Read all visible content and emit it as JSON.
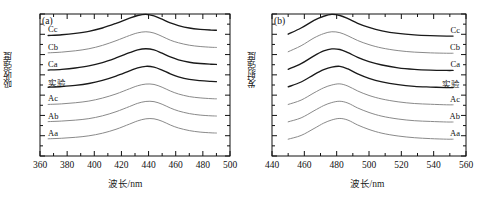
{
  "figure": {
    "panels": [
      {
        "tag": "(a)",
        "xlabel": "波长/nm",
        "ylabel": "吸收强度",
        "label_side": "left"
      },
      {
        "tag": "(b)",
        "xlabel": "波长/nm",
        "ylabel": "发射强度",
        "label_side": "right"
      }
    ]
  },
  "chart_data": [
    {
      "type": "line",
      "title": "(a)",
      "xlabel": "波长/nm",
      "ylabel": "吸收强度",
      "xlim": [
        360,
        500
      ],
      "ylim": [
        0,
        7.6
      ],
      "xticks": [
        360,
        380,
        400,
        420,
        440,
        460,
        480,
        500
      ],
      "xtick_labels": [
        "360",
        "380",
        "400",
        "420",
        "440",
        "460",
        "480",
        "500"
      ],
      "yticks": [],
      "ytick_labels": [],
      "minor_tick_step": 10,
      "grid": false,
      "legend": "inline-curve-labels",
      "x": [
        366,
        376,
        386,
        396,
        406,
        416,
        426,
        432,
        438,
        444,
        450,
        456,
        462,
        470,
        478,
        486,
        490
      ],
      "series": [
        {
          "name": "Cc",
          "label": "Cc",
          "color": "#1a1a1a",
          "peak_nm": 438,
          "baseline": 6.45,
          "values": [
            6.45,
            6.49,
            6.56,
            6.67,
            6.85,
            7.1,
            7.38,
            7.52,
            7.58,
            7.5,
            7.32,
            7.12,
            6.98,
            6.85,
            6.78,
            6.74,
            6.73
          ]
        },
        {
          "name": "Cb",
          "label": "Cb",
          "color": "#8a8a8a",
          "peak_nm": 439,
          "baseline": 5.52,
          "values": [
            5.52,
            5.56,
            5.63,
            5.74,
            5.92,
            6.17,
            6.45,
            6.59,
            6.65,
            6.58,
            6.4,
            6.2,
            6.06,
            5.93,
            5.86,
            5.82,
            5.81
          ]
        },
        {
          "name": "Ca",
          "label": "Ca",
          "color": "#1a1a1a",
          "peak_nm": 441,
          "baseline": 4.6,
          "values": [
            4.6,
            4.64,
            4.71,
            4.82,
            5.0,
            5.25,
            5.53,
            5.68,
            5.74,
            5.68,
            5.5,
            5.3,
            5.15,
            5.02,
            4.95,
            4.91,
            4.9
          ]
        },
        {
          "name": "实验",
          "label": "实验",
          "color": "#1a1a1a",
          "peak_nm": 443,
          "baseline": 3.68,
          "values": [
            3.68,
            3.72,
            3.78,
            3.88,
            4.05,
            4.28,
            4.56,
            4.72,
            4.8,
            4.76,
            4.6,
            4.4,
            4.24,
            4.1,
            4.03,
            3.99,
            3.98
          ]
        },
        {
          "name": "Ac",
          "label": "Ac",
          "color": "#8a8a8a",
          "peak_nm": 445,
          "baseline": 2.76,
          "values": [
            2.76,
            2.79,
            2.85,
            2.94,
            3.1,
            3.32,
            3.6,
            3.76,
            3.85,
            3.83,
            3.68,
            3.48,
            3.32,
            3.18,
            3.11,
            3.07,
            3.06
          ]
        },
        {
          "name": "Ab",
          "label": "Ab",
          "color": "#8a8a8a",
          "peak_nm": 446,
          "baseline": 1.84,
          "values": [
            1.84,
            1.87,
            1.92,
            2.0,
            2.15,
            2.37,
            2.65,
            2.82,
            2.92,
            2.91,
            2.77,
            2.57,
            2.41,
            2.27,
            2.19,
            2.15,
            2.14
          ]
        },
        {
          "name": "Aa",
          "label": "Aa",
          "color": "#8a8a8a",
          "peak_nm": 447,
          "baseline": 0.92,
          "values": [
            0.92,
            0.95,
            1.0,
            1.08,
            1.22,
            1.43,
            1.71,
            1.88,
            1.99,
            1.99,
            1.86,
            1.66,
            1.5,
            1.36,
            1.28,
            1.24,
            1.23
          ]
        }
      ]
    },
    {
      "type": "line",
      "title": "(b)",
      "xlabel": "波长/nm",
      "ylabel": "发射强度",
      "xlim": [
        440,
        560
      ],
      "ylim": [
        0,
        7.6
      ],
      "xticks": [
        440,
        460,
        480,
        500,
        520,
        540,
        560
      ],
      "xtick_labels": [
        "440",
        "460",
        "480",
        "500",
        "520",
        "540",
        "560"
      ],
      "yticks": [],
      "ytick_labels": [],
      "minor_tick_step": 10,
      "grid": false,
      "legend": "inline-curve-labels",
      "x": [
        450,
        458,
        466,
        472,
        477,
        482,
        487,
        493,
        500,
        508,
        518,
        528,
        538,
        548,
        552
      ],
      "series": [
        {
          "name": "Cc",
          "label": "Cc",
          "color": "#1a1a1a",
          "peak_nm": 477,
          "baseline": 6.42,
          "values": [
            6.52,
            6.85,
            7.26,
            7.48,
            7.58,
            7.52,
            7.35,
            7.1,
            6.88,
            6.7,
            6.56,
            6.48,
            6.44,
            6.42,
            6.42
          ]
        },
        {
          "name": "Cb",
          "label": "Cb",
          "color": "#8a8a8a",
          "peak_nm": 478,
          "baseline": 5.5,
          "values": [
            5.58,
            5.9,
            6.32,
            6.55,
            6.65,
            6.6,
            6.43,
            6.18,
            5.96,
            5.78,
            5.64,
            5.56,
            5.52,
            5.5,
            5.5
          ]
        },
        {
          "name": "Ca",
          "label": "Ca",
          "color": "#1a1a1a",
          "peak_nm": 481,
          "baseline": 4.58,
          "values": [
            4.64,
            4.94,
            5.36,
            5.62,
            5.73,
            5.7,
            5.53,
            5.28,
            5.05,
            4.87,
            4.72,
            4.64,
            4.6,
            4.58,
            4.58
          ]
        },
        {
          "name": "实验",
          "label": "实验",
          "color": "#1a1a1a",
          "peak_nm": 484,
          "baseline": 3.66,
          "values": [
            3.7,
            3.96,
            4.36,
            4.62,
            4.76,
            4.8,
            4.66,
            4.4,
            4.16,
            3.97,
            3.82,
            3.73,
            3.69,
            3.66,
            3.66
          ]
        },
        {
          "name": "Ac",
          "label": "Ac",
          "color": "#8a8a8a",
          "peak_nm": 486,
          "baseline": 2.74,
          "values": [
            2.76,
            2.99,
            3.38,
            3.65,
            3.8,
            3.86,
            3.74,
            3.48,
            3.24,
            3.05,
            2.9,
            2.81,
            2.77,
            2.74,
            2.74
          ]
        },
        {
          "name": "Ab",
          "label": "Ab",
          "color": "#8a8a8a",
          "peak_nm": 487,
          "baseline": 1.82,
          "values": [
            1.83,
            2.04,
            2.42,
            2.7,
            2.86,
            2.93,
            2.83,
            2.57,
            2.33,
            2.13,
            1.98,
            1.89,
            1.85,
            1.82,
            1.82
          ]
        },
        {
          "name": "Aa",
          "label": "Aa",
          "color": "#8a8a8a",
          "peak_nm": 488,
          "baseline": 0.9,
          "values": [
            0.9,
            1.1,
            1.47,
            1.76,
            1.93,
            2.01,
            1.92,
            1.66,
            1.42,
            1.22,
            1.07,
            0.98,
            0.93,
            0.9,
            0.9
          ]
        }
      ]
    }
  ]
}
